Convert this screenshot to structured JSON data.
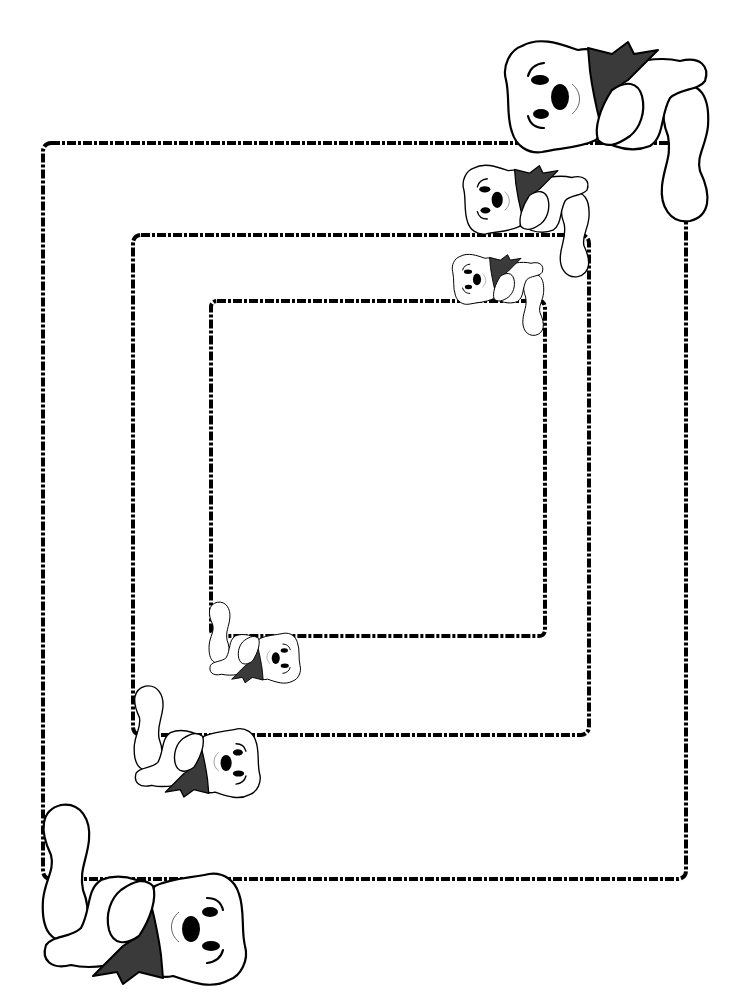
{
  "page": {
    "background": "#ffffff",
    "line_color": "#000000",
    "scarf_color": "#3a3a3a"
  },
  "frames": [
    {
      "name": "outer-frame",
      "x": 43,
      "y": 143,
      "w": 643,
      "h": 736,
      "r": 8
    },
    {
      "name": "middle-frame",
      "x": 133,
      "y": 235,
      "w": 456,
      "h": 500,
      "r": 8
    },
    {
      "name": "inner-frame",
      "x": 211,
      "y": 301,
      "w": 334,
      "h": 335,
      "r": 6
    }
  ],
  "bears": [
    {
      "name": "bear-top-large",
      "x": 500,
      "y": 36,
      "scale": 1.0,
      "rotate": 0
    },
    {
      "name": "bear-top-medium",
      "x": 460,
      "y": 162,
      "scale": 0.62,
      "rotate": 0
    },
    {
      "name": "bear-top-small",
      "x": 450,
      "y": 252,
      "scale": 0.45,
      "rotate": 0
    },
    {
      "name": "bear-bottom-small",
      "x": 206,
      "y": 600,
      "scale": 0.45,
      "rotate": 180
    },
    {
      "name": "bear-bottom-medium",
      "x": 130,
      "y": 683,
      "scale": 0.62,
      "rotate": 180
    },
    {
      "name": "bear-bottom-large",
      "x": 36,
      "y": 800,
      "scale": 1.0,
      "rotate": 180
    }
  ]
}
